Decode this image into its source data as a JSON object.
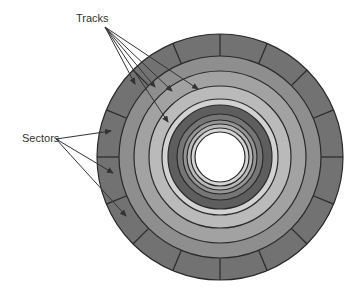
{
  "figure": {
    "labels": {
      "tracks": "Tracks",
      "sectors": "Sectors"
    }
  },
  "disk": {
    "center": [
      220,
      157
    ],
    "outer_radius": 123,
    "hole_radius": 25,
    "sector_count": 16,
    "sector_band": {
      "outer": 123,
      "inner": 101,
      "color": "#727272"
    },
    "rings": [
      {
        "outer": 101,
        "inner": 86,
        "color": "#8e8e8e"
      },
      {
        "outer": 86,
        "inner": 71,
        "color": "#a2a2a2"
      },
      {
        "outer": 71,
        "inner": 58,
        "color": "#bababa"
      },
      {
        "outer": 58,
        "inner": 52,
        "color": "#d2d2d2"
      },
      {
        "outer": 52,
        "inner": 43,
        "color": "#5e5e5e"
      },
      {
        "outer": 43,
        "inner": 37,
        "color": "#767676"
      },
      {
        "outer": 37,
        "inner": 33,
        "color": "#959595"
      },
      {
        "outer": 33,
        "inner": 29,
        "color": "#b8b8b8"
      },
      {
        "outer": 29,
        "inner": 25,
        "color": "#d4d4d4"
      }
    ],
    "line_color": "#2a2a2a"
  },
  "annotations": {
    "tracks_arrows": {
      "origin": [
        105,
        27
      ],
      "targets": [
        [
          135,
          84
        ],
        [
          155,
          87
        ],
        [
          172,
          91
        ],
        [
          198,
          89
        ],
        [
          168,
          122
        ]
      ]
    },
    "sectors_arrows": {
      "origin": [
        56,
        139
      ],
      "targets": [
        [
          111,
          131
        ],
        [
          113,
          173
        ],
        [
          126,
          216
        ]
      ]
    },
    "arrow_color": "#333333"
  }
}
